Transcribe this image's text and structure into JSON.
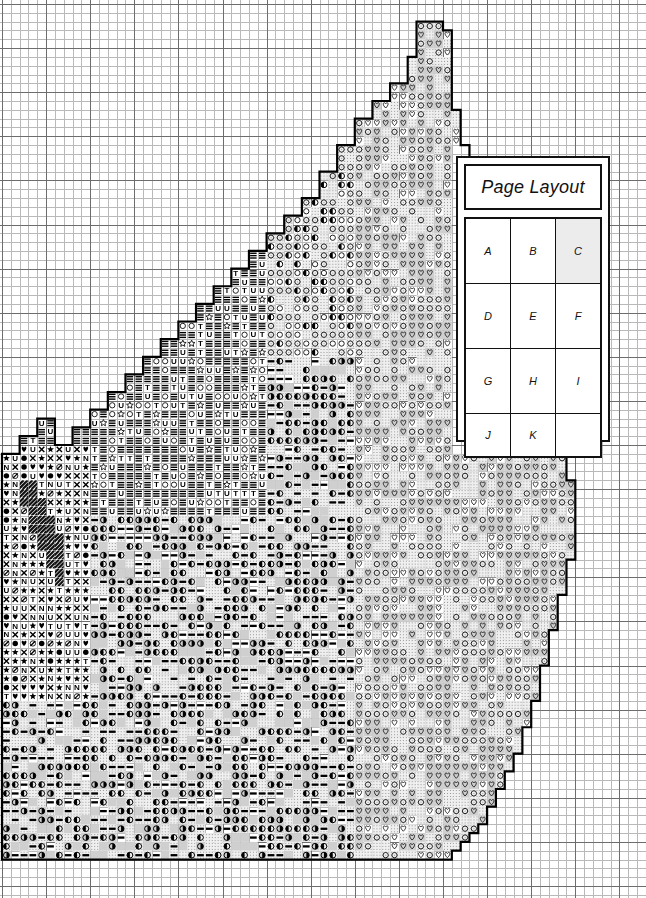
{
  "document": {
    "kind": "cross-stitch-pattern-chart",
    "width": 646,
    "height": 898
  },
  "grid": {
    "cell_px": 8.82,
    "bold_every": 5,
    "fine_color": "#b9b9b9",
    "bold_color": "#6d6d6d",
    "background": "#ffffff",
    "cols": 73,
    "rows": 100,
    "origin_x": 2,
    "origin_y": 4
  },
  "legend": {
    "title": "Page Layout",
    "highlight_color": "#ececec",
    "border_color": "#111111",
    "pages": [
      [
        {
          "label": "A",
          "highlighted": false
        },
        {
          "label": "B",
          "highlighted": false
        },
        {
          "label": "C",
          "highlighted": true
        }
      ],
      [
        {
          "label": "D",
          "highlighted": false
        },
        {
          "label": "E",
          "highlighted": false
        },
        {
          "label": "F",
          "highlighted": false
        }
      ],
      [
        {
          "label": "G",
          "highlighted": false
        },
        {
          "label": "H",
          "highlighted": false
        },
        {
          "label": "I",
          "highlighted": false
        }
      ],
      [
        {
          "label": "J",
          "highlighted": false
        },
        {
          "label": "K",
          "highlighted": false
        },
        {
          "label": "",
          "highlighted": false
        }
      ]
    ]
  },
  "chart_data": {
    "type": "heatmap",
    "title": "Page Layout",
    "xlabel": "",
    "ylabel": "",
    "grid": true,
    "legend_position": "right",
    "symbol_key": [
      {
        "id": "blank",
        "glyph": "",
        "name": "empty-cell",
        "fill": "#ffffff"
      },
      {
        "id": "dotlt",
        "glyph": "",
        "name": "light-dot-fill",
        "fill": "#f0f0f0"
      },
      {
        "id": "gray",
        "glyph": "",
        "name": "gray-fill",
        "fill": "#cfcfcf"
      },
      {
        "id": "heart_o",
        "glyph": "♡",
        "name": "open-heart",
        "fill": "#ffffff"
      },
      {
        "id": "heart_f",
        "glyph": "♥",
        "name": "filled-heart",
        "fill": "#ffffff"
      },
      {
        "id": "circ_o",
        "glyph": "○",
        "name": "open-circle",
        "fill": "#ffffff"
      },
      {
        "id": "circ_f",
        "glyph": "●",
        "name": "filled-circle",
        "fill": "#ffffff"
      },
      {
        "id": "half_l",
        "glyph": "◐",
        "name": "half-circle-left",
        "fill": "#ffffff"
      },
      {
        "id": "half_r",
        "glyph": "◑",
        "name": "half-circle-right",
        "fill": "#ffffff"
      },
      {
        "id": "star",
        "glyph": "★",
        "name": "filled-star",
        "fill": "#ffffff"
      },
      {
        "id": "star_o",
        "glyph": "☆",
        "name": "open-star",
        "fill": "#ffffff"
      },
      {
        "id": "cross",
        "glyph": "✕",
        "name": "cross-x",
        "fill": "#ffffff"
      },
      {
        "id": "slashO",
        "glyph": "⊘",
        "name": "slashed-circle",
        "fill": "#ffffff"
      },
      {
        "id": "tee",
        "glyph": "T",
        "name": "letter-t",
        "fill": "#ffffff"
      },
      {
        "id": "ewe",
        "glyph": "U",
        "name": "letter-u",
        "fill": "#ffffff"
      },
      {
        "id": "enn",
        "glyph": "N",
        "name": "letter-n",
        "fill": "#ffffff"
      },
      {
        "id": "bars",
        "glyph": "≡",
        "name": "triple-bar",
        "fill": "#ffffff"
      },
      {
        "id": "dash",
        "glyph": "▬",
        "name": "solid-dash",
        "fill": "#ffffff"
      },
      {
        "id": "hatch",
        "glyph": "",
        "name": "diagonal-hatch",
        "fill": "#303030"
      }
    ],
    "regions": [
      {
        "name": "upper-spire",
        "symbols": [
          "circ_o",
          "half_l",
          "dotlt"
        ]
      },
      {
        "name": "upper-left-slope",
        "symbols": [
          "bars",
          "tee",
          "ewe",
          "star_o",
          "circ_o"
        ]
      },
      {
        "name": "left-dense-block",
        "symbols": [
          "heart_f",
          "star",
          "cross",
          "slashO",
          "circ_f",
          "tee",
          "ewe",
          "enn"
        ]
      },
      {
        "name": "hatch-band",
        "symbols": [
          "hatch"
        ]
      },
      {
        "name": "center-body",
        "symbols": [
          "half_l",
          "half_r",
          "dash",
          "gray",
          "dotlt"
        ]
      },
      {
        "name": "right-heart-field",
        "symbols": [
          "heart_o",
          "circ_o",
          "gray"
        ]
      },
      {
        "name": "bottom-texture",
        "symbols": [
          "dash",
          "star",
          "circ_o",
          "half_l",
          "dotlt",
          "gray"
        ]
      }
    ],
    "outline": {
      "color": "#000000",
      "style": "stepped-stitch-border",
      "description": "Stepped motif boundary enclosing the stitched area; apex near top-right, widening down-left."
    }
  }
}
